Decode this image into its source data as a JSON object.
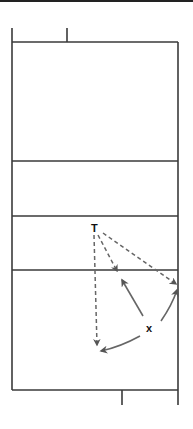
{
  "diagram": {
    "players": [
      {
        "id": "T",
        "label": "T",
        "role": "tosser"
      },
      {
        "id": "X",
        "label": "x",
        "role": "player"
      }
    ],
    "movements": [
      {
        "from": "T",
        "to": "left-deep",
        "style": "dashed",
        "meaning": "ball path"
      },
      {
        "from": "T",
        "to": "center-net",
        "style": "dashed",
        "meaning": "ball path"
      },
      {
        "from": "T",
        "to": "right-sideline",
        "style": "dashed",
        "meaning": "ball path"
      },
      {
        "from": "X",
        "to": "center-net",
        "style": "solid",
        "meaning": "player movement"
      },
      {
        "from": "X",
        "to": "right-sideline",
        "style": "solid",
        "meaning": "player movement"
      },
      {
        "from": "X",
        "to": "left-deep",
        "style": "solid",
        "meaning": "player movement"
      }
    ],
    "colors": {
      "court_line": "#3a3a3a",
      "arrow": "#666666",
      "label": "#111111"
    }
  }
}
